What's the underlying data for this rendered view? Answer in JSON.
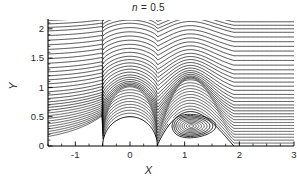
{
  "figure": {
    "title_var": "n",
    "title_eq": " = 0.5",
    "title_full": "n = 0.5",
    "xlabel": "X",
    "ylabel": "Y",
    "background": "#ffffff",
    "line_color": "#000000"
  },
  "chart_data": {
    "type": "line",
    "title": "n = 0.5",
    "xlabel": "X",
    "ylabel": "Y",
    "xlim": [
      -1.5,
      3.0
    ],
    "ylim": [
      0.0,
      2.15
    ],
    "xticks": [
      -1,
      0,
      1,
      2,
      3
    ],
    "xticklabels": [
      "-1",
      "0",
      "1",
      "2",
      "3"
    ],
    "yticks": [
      0,
      0.5,
      1,
      1.5,
      2
    ],
    "yticklabels": [
      "0",
      "0.5",
      "1",
      "1.5",
      "2"
    ],
    "x_minor_tick_step": 0.25,
    "y_minor_tick_step": 0.1,
    "grid": false,
    "legend": false,
    "spines": [
      "left",
      "bottom"
    ],
    "obstacle": {
      "shape": "semicircle",
      "center_x": 0.0,
      "center_y": 0.0,
      "radius": 0.5
    },
    "vortex": {
      "center_x": 1.12,
      "center_y": 0.34,
      "semi_axis_x": 0.42,
      "semi_axis_y": 0.21,
      "rings": 9,
      "separation_x": 0.5,
      "reattachment_x": 1.9
    },
    "streamlines": {
      "count": 34,
      "inlet_y_values": [
        0.05,
        0.1,
        0.15,
        0.2,
        0.25,
        0.3,
        0.35,
        0.4,
        0.45,
        0.5,
        0.55,
        0.6,
        0.65,
        0.7,
        0.76,
        0.82,
        0.88,
        0.95,
        1.02,
        1.09,
        1.16,
        1.23,
        1.3,
        1.38,
        1.46,
        1.54,
        1.62,
        1.7,
        1.78,
        1.86,
        1.94,
        2.0,
        2.06,
        2.12
      ]
    }
  }
}
